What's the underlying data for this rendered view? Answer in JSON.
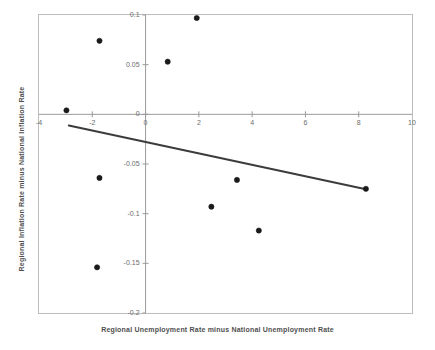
{
  "chart_data": {
    "type": "scatter",
    "title": "",
    "subtitle": "",
    "xlabel": "Regional Unemployment Rate minus National Unemployment Rate",
    "ylabel": "Regional Inflation Rate minus National Inflation Rate",
    "xlim": [
      -4,
      10
    ],
    "ylim": [
      -0.2,
      0.1
    ],
    "xticks": [
      -4,
      -2,
      0,
      2,
      4,
      6,
      8,
      10
    ],
    "xtick_labels": [
      "-4",
      "-2",
      "0",
      "2",
      "4",
      "6",
      "8",
      "10"
    ],
    "yticks": [
      0.1,
      0.05,
      0,
      -0.05,
      -0.1,
      -0.15,
      -0.2
    ],
    "ytick_labels": [
      "0.1",
      "0.05",
      "0",
      "-0.05",
      "-0.1",
      "-0.15",
      "-0.2"
    ],
    "grid": false,
    "legend": null,
    "legend_position": "none",
    "marker_color": "#1a1a1a",
    "line_color": "#3c3c3c",
    "frame_color": "#b8b8b8",
    "axis_color": "#9a9a9a",
    "points": [
      {
        "x": -2.97,
        "y": 0.004
      },
      {
        "x": -1.73,
        "y": 0.074
      },
      {
        "x": 0.83,
        "y": 0.053
      },
      {
        "x": 1.92,
        "y": 0.097
      },
      {
        "x": -1.73,
        "y": -0.064
      },
      {
        "x": 3.43,
        "y": -0.066
      },
      {
        "x": 2.47,
        "y": -0.093
      },
      {
        "x": 4.25,
        "y": -0.117
      },
      {
        "x": -1.82,
        "y": -0.154
      },
      {
        "x": 8.27,
        "y": -0.075
      }
    ],
    "trendline": {
      "x_start": -2.88,
      "y_start": -0.0113,
      "x_end": 8.27,
      "y_end": -0.0754,
      "label": "fitted regression line"
    }
  }
}
